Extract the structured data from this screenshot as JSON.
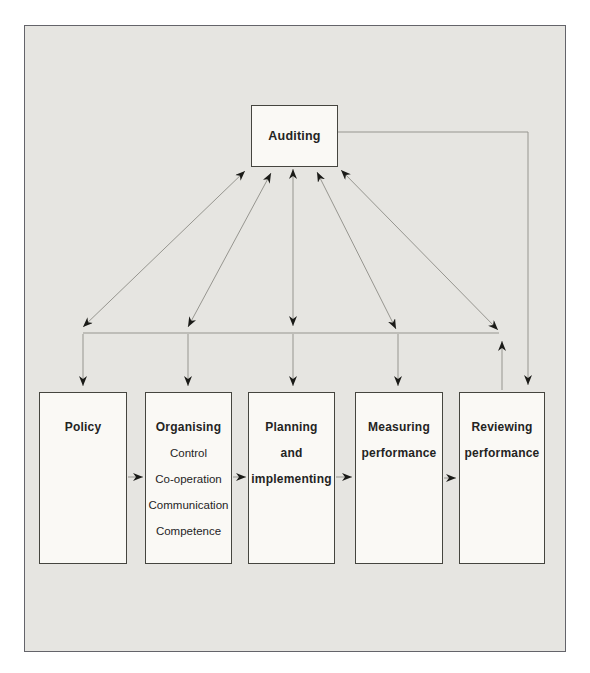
{
  "theme": {
    "bg_outer": "#ffffff",
    "bg_inner": "#e6e5e1",
    "box_fill": "#faf9f5",
    "box_border": "#45453f",
    "frame_border": "#64646a",
    "line_color": "#96958f",
    "arrow_color": "#1b1b18",
    "text_color": "#24241f"
  },
  "diagram": {
    "top_box": {
      "label": "Auditing"
    },
    "boxes": [
      {
        "id": "policy",
        "lines": [
          "Policy"
        ],
        "items": []
      },
      {
        "id": "organising",
        "lines": [
          "Organising"
        ],
        "items": [
          "Control",
          "Co-operation",
          "Communication",
          "Competence"
        ]
      },
      {
        "id": "planning",
        "lines": [
          "Planning",
          "and",
          "implementing"
        ],
        "items": []
      },
      {
        "id": "measuring",
        "lines": [
          "Measuring",
          "performance"
        ],
        "items": []
      },
      {
        "id": "reviewing",
        "lines": [
          "Reviewing",
          "performance"
        ],
        "items": []
      }
    ],
    "edges": [
      {
        "from": "auditing",
        "to": "policy",
        "style": "double-arrow"
      },
      {
        "from": "auditing",
        "to": "organising",
        "style": "double-arrow"
      },
      {
        "from": "auditing",
        "to": "planning",
        "style": "double-arrow"
      },
      {
        "from": "auditing",
        "to": "measuring",
        "style": "double-arrow"
      },
      {
        "from": "auditing",
        "to": "reviewing",
        "style": "double-arrow"
      },
      {
        "from": "auditing",
        "to": "reviewing",
        "style": "direct-right-route-arrow"
      },
      {
        "from": "policy",
        "to": "organising",
        "style": "arrow"
      },
      {
        "from": "organising",
        "to": "planning",
        "style": "arrow"
      },
      {
        "from": "planning",
        "to": "measuring",
        "style": "arrow"
      },
      {
        "from": "measuring",
        "to": "reviewing",
        "style": "arrow"
      }
    ]
  }
}
